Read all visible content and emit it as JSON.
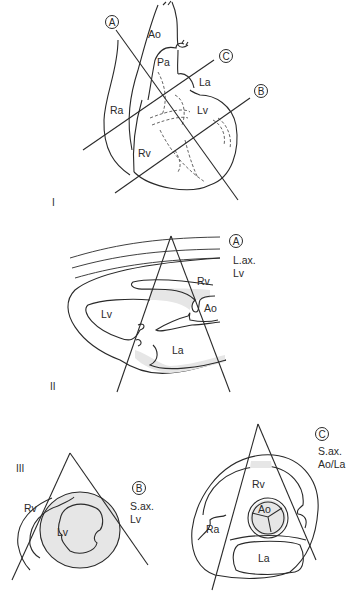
{
  "figure": {
    "panel_I": {
      "roman": "I",
      "labels": {
        "ao": "Ao",
        "pa": "Pa",
        "la": "La",
        "lv": "Lv",
        "ra": "Ra",
        "rv": "Rv"
      },
      "planes": {
        "a": "A",
        "b": "B",
        "c": "C"
      }
    },
    "panel_II": {
      "roman": "II",
      "plane": "A",
      "view_line1": "L.ax.",
      "view_line2": "Lv",
      "labels": {
        "rv": "Rv",
        "ao": "Ao",
        "lv": "Lv",
        "la": "La"
      }
    },
    "panel_III": {
      "roman": "III",
      "left": {
        "plane": "B",
        "view_line1": "S.ax.",
        "view_line2": "Lv",
        "labels": {
          "rv": "Rv",
          "lv": "Lv"
        }
      },
      "right": {
        "plane": "C",
        "view_line1": "S.ax.",
        "view_line2": "Ao/La",
        "labels": {
          "rv": "Rv",
          "ao": "Ao",
          "ra": "Ra",
          "la": "La"
        }
      }
    }
  }
}
